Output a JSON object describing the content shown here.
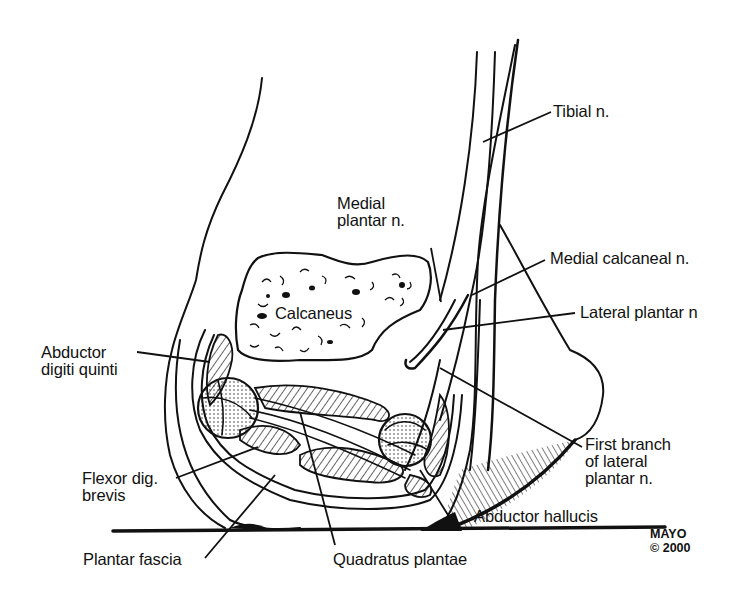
{
  "figure": {
    "type": "anatomical line drawing",
    "colors": {
      "ink": "#111111",
      "background": "#ffffff"
    }
  },
  "labels": {
    "tibial_n": "Tibial n.",
    "medial_plantar_n": "Medial\nplantar n.",
    "medial_calcaneal_n": "Medial calcaneal n.",
    "lateral_plantar_n": "Lateral plantar n",
    "abductor_digiti_quinti": "Abductor\ndigiti quinti",
    "calcaneus": "Calcaneus",
    "first_branch_lateral_plantar_n": "First branch\nof lateral\nplantar n.",
    "flexor_dig_brevis": "Flexor dig.\nbrevis",
    "abductor_hallucis": "Abductor hallucis",
    "plantar_fascia": "Plantar fascia",
    "quadratus_plantae": "Quadratus plantae"
  },
  "credit": {
    "org": "MAYO",
    "copyright": "© 2000"
  }
}
